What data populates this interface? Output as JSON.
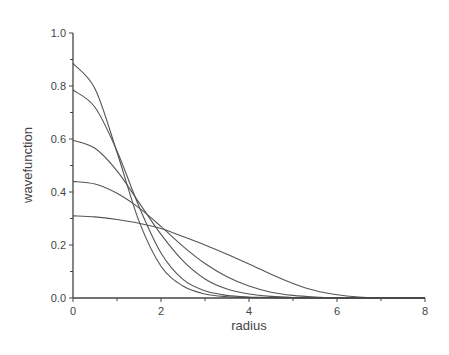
{
  "chart_data": {
    "type": "line",
    "title": "",
    "xlabel": "radius",
    "ylabel": "wavefunction",
    "xlim": [
      0,
      8
    ],
    "ylim": [
      0,
      1.0
    ],
    "grid": false,
    "legend": null,
    "x_ticks": [
      "0",
      "2",
      "4",
      "6",
      "8"
    ],
    "y_ticks": [
      "0.0",
      "0.2",
      "0.4",
      "0.6",
      "0.8",
      "1.0"
    ],
    "x": [
      0,
      0.5,
      1,
      1.5,
      2,
      2.5,
      3,
      3.5,
      4,
      4.5,
      5,
      5.5,
      6,
      6.5,
      7,
      7.5,
      8
    ],
    "series": [
      {
        "name": "curve-1",
        "values": [
          0.885,
          0.79,
          0.55,
          0.29,
          0.12,
          0.045,
          0.015,
          0.005,
          0.002,
          0.001,
          0,
          0,
          0,
          0,
          0,
          0,
          0
        ]
      },
      {
        "name": "curve-2",
        "values": [
          0.785,
          0.72,
          0.555,
          0.345,
          0.17,
          0.07,
          0.027,
          0.01,
          0.004,
          0.002,
          0.001,
          0,
          0,
          0,
          0,
          0,
          0
        ]
      },
      {
        "name": "curve-3",
        "values": [
          0.595,
          0.565,
          0.48,
          0.36,
          0.24,
          0.14,
          0.072,
          0.034,
          0.015,
          0.006,
          0.002,
          0.001,
          0,
          0,
          0,
          0,
          0
        ]
      },
      {
        "name": "curve-4",
        "values": [
          0.44,
          0.43,
          0.395,
          0.34,
          0.27,
          0.195,
          0.13,
          0.08,
          0.045,
          0.022,
          0.01,
          0.004,
          0.001,
          0,
          0,
          0,
          0
        ]
      },
      {
        "name": "curve-5",
        "values": [
          0.31,
          0.306,
          0.296,
          0.282,
          0.262,
          0.232,
          0.2,
          0.165,
          0.128,
          0.09,
          0.055,
          0.028,
          0.012,
          0.004,
          0.001,
          0,
          0
        ]
      }
    ]
  },
  "colors": {
    "line": "#555555",
    "axis": "#444444"
  }
}
